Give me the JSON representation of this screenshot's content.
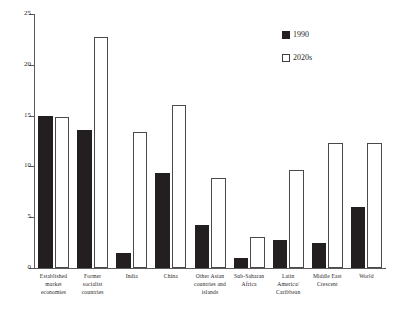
{
  "chart_data": {
    "type": "bar",
    "title": "",
    "subtitle": "",
    "xlabel": "",
    "ylabel": "",
    "ylim": [
      0,
      25
    ],
    "yticks": [
      0,
      5,
      10,
      15,
      20,
      25
    ],
    "ytick_labels": [
      "0",
      "5",
      "10",
      "15",
      "20",
      "25"
    ],
    "grid": false,
    "legend_position": "top-right",
    "categories": [
      "Established market economies",
      "Former socialist countries",
      "India",
      "China",
      "Other Asian countries and islands",
      "Sub-Saharan Africa",
      "Latin America/ Caribbean",
      "Middle East Crescent",
      "World"
    ],
    "category_lines": [
      [
        "Established",
        "market",
        "economies"
      ],
      [
        "Former",
        "socialist",
        "countries"
      ],
      [
        "India"
      ],
      [
        "China"
      ],
      [
        "Other Asian",
        "countries and",
        "islands"
      ],
      [
        "Sub-Saharan",
        "Africa"
      ],
      [
        "Latin",
        "America/",
        "Caribbean"
      ],
      [
        "Middle East",
        "Crescent"
      ],
      [
        "World"
      ]
    ],
    "series": [
      {
        "name": "1990",
        "color": "#231f20",
        "style": "filled",
        "values": [
          15.0,
          13.6,
          1.5,
          9.4,
          4.2,
          1.0,
          2.8,
          2.5,
          6.0
        ]
      },
      {
        "name": "2020s",
        "color": "#ffffff",
        "style": "open",
        "values": [
          14.9,
          22.7,
          13.4,
          16.0,
          8.9,
          3.1,
          9.6,
          12.3,
          12.3
        ]
      }
    ]
  },
  "legend": {
    "items": [
      {
        "label": "1990",
        "swatch": "filled-square-icon"
      },
      {
        "label": "2020s",
        "swatch": "open-square-icon"
      }
    ]
  },
  "colors": {
    "series_1990": "#231f20",
    "series_2020s": "#ffffff",
    "axis": "#5a5a5a",
    "text": "#1f1f1f",
    "background": "#ffffff"
  }
}
